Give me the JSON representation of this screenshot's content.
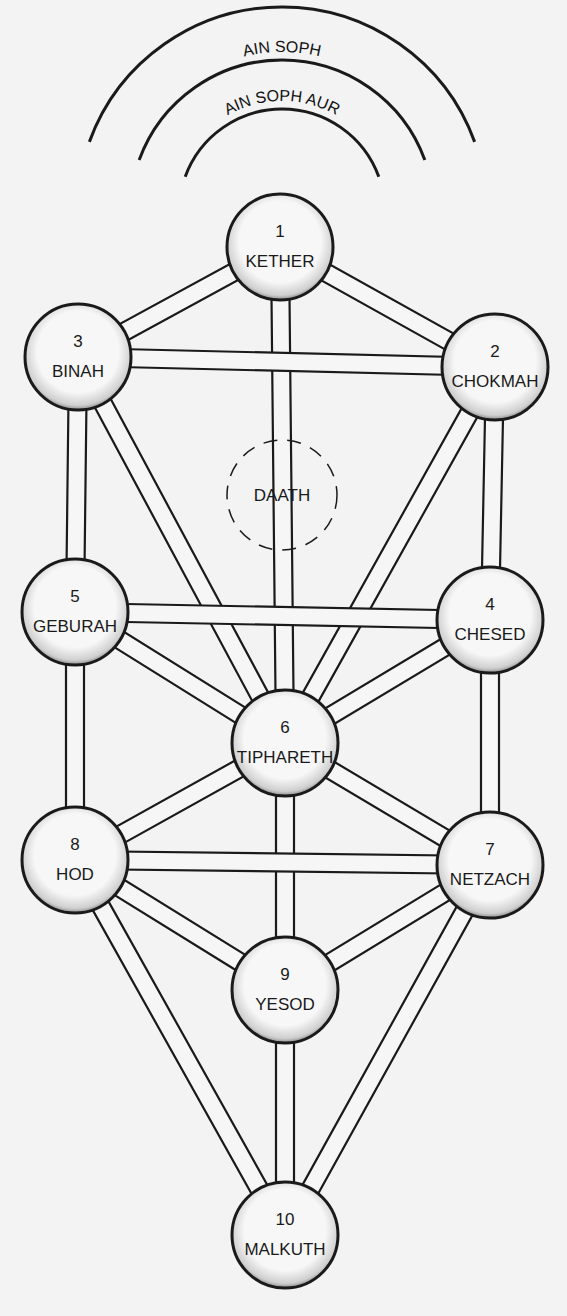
{
  "veils": [
    {
      "id": "ain",
      "label": "AIN",
      "r": 205
    },
    {
      "id": "ain-soph",
      "label": "AIN SOPH",
      "r": 152
    },
    {
      "id": "ain-soph-aur",
      "label": "AIN SOPH AUR",
      "r": 103
    }
  ],
  "veil_center": {
    "x": 282,
    "y": 212
  },
  "sephiroth": [
    {
      "id": "kether",
      "number": "1",
      "name": "KETHER",
      "x": 280,
      "y": 247
    },
    {
      "id": "chokmah",
      "number": "2",
      "name": "CHOKMAH",
      "x": 495,
      "y": 367
    },
    {
      "id": "binah",
      "number": "3",
      "name": "BINAH",
      "x": 78,
      "y": 357
    },
    {
      "id": "chesed",
      "number": "4",
      "name": "CHESED",
      "x": 490,
      "y": 620
    },
    {
      "id": "geburah",
      "number": "5",
      "name": "GEBURAH",
      "x": 75,
      "y": 612
    },
    {
      "id": "tiphareth",
      "number": "6",
      "name": "TIPHARETH",
      "x": 285,
      "y": 743
    },
    {
      "id": "netzach",
      "number": "7",
      "name": "NETZACH",
      "x": 490,
      "y": 865
    },
    {
      "id": "hod",
      "number": "8",
      "name": "HOD",
      "x": 75,
      "y": 860
    },
    {
      "id": "yesod",
      "number": "9",
      "name": "YESOD",
      "x": 285,
      "y": 990
    },
    {
      "id": "malkuth",
      "number": "10",
      "name": "MALKUTH",
      "x": 285,
      "y": 1235
    }
  ],
  "daath": {
    "name": "DAATH",
    "x": 282,
    "y": 495
  },
  "paths": [
    [
      "kether",
      "binah"
    ],
    [
      "kether",
      "chokmah"
    ],
    [
      "kether",
      "tiphareth"
    ],
    [
      "binah",
      "chokmah"
    ],
    [
      "binah",
      "geburah"
    ],
    [
      "binah",
      "tiphareth"
    ],
    [
      "chokmah",
      "chesed"
    ],
    [
      "chokmah",
      "tiphareth"
    ],
    [
      "geburah",
      "chesed"
    ],
    [
      "geburah",
      "tiphareth"
    ],
    [
      "geburah",
      "hod"
    ],
    [
      "chesed",
      "tiphareth"
    ],
    [
      "chesed",
      "netzach"
    ],
    [
      "tiphareth",
      "hod"
    ],
    [
      "tiphareth",
      "netzach"
    ],
    [
      "tiphareth",
      "yesod"
    ],
    [
      "hod",
      "netzach"
    ],
    [
      "hod",
      "yesod"
    ],
    [
      "hod",
      "malkuth"
    ],
    [
      "netzach",
      "yesod"
    ],
    [
      "netzach",
      "malkuth"
    ],
    [
      "yesod",
      "malkuth"
    ]
  ],
  "style": {
    "ink": "#1a1a1a",
    "fill": "#f4f4f4",
    "paper": "#f3f3f3"
  }
}
